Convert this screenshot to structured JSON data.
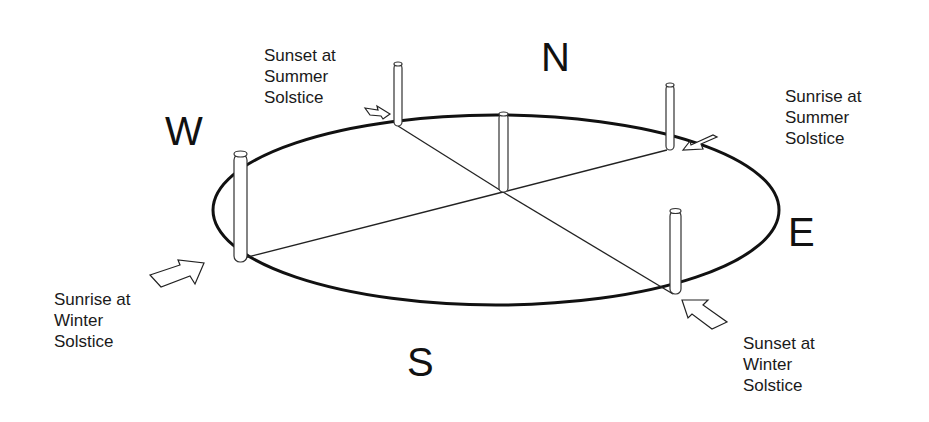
{
  "directions": {
    "north": "N",
    "south": "S",
    "east": "E",
    "west": "W"
  },
  "labels": {
    "sunset_summer": "Sunset at\nSummer\nSolstice",
    "sunrise_summer": "Sunrise at\nSummer\nSolstice",
    "sunrise_winter": "Sunrise at\nWinter\nSolstice",
    "sunset_winter": "Sunset at\nWinter\nSolstice"
  },
  "colors": {
    "stroke": "#111111",
    "background": "#ffffff"
  }
}
